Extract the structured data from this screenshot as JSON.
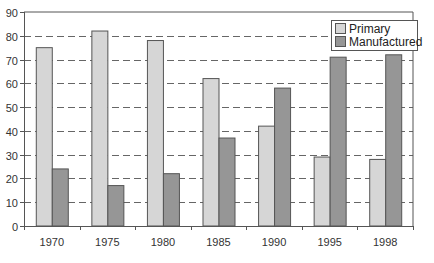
{
  "chart_data": {
    "type": "bar",
    "title": "",
    "xlabel": "",
    "ylabel": "",
    "categories": [
      "1970",
      "1975",
      "1980",
      "1985",
      "1990",
      "1995",
      "1998"
    ],
    "series": [
      {
        "name": "Primary",
        "color": "#d6d6d6",
        "values": [
          75,
          82,
          78,
          62,
          42,
          29,
          28
        ]
      },
      {
        "name": "Manufactured",
        "color": "#969696",
        "values": [
          24,
          17,
          22,
          37,
          58,
          71,
          72
        ]
      }
    ],
    "ylim": [
      0,
      90
    ],
    "yticks": [
      0,
      10,
      20,
      30,
      40,
      50,
      60,
      70,
      80,
      90
    ],
    "grid": "horizontal dashed",
    "legend_position": "top-right inside"
  }
}
